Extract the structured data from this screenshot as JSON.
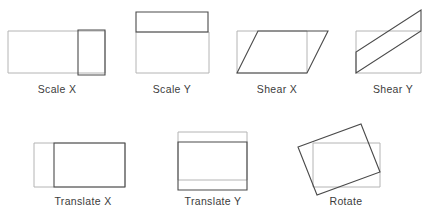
{
  "figure": {
    "width": 436,
    "height": 219,
    "background_color": "#ffffff",
    "original_shape_color": "#b4b4b4",
    "transformed_shape_color": "#4a4a4a",
    "label_color": "#3c3c3c"
  },
  "cells": [
    {
      "id": "scale-x",
      "label": "Scale X",
      "label_x": 57,
      "label_y": 93,
      "original": {
        "type": "rect",
        "points": "8,31 105,31 105,73 8,73"
      },
      "transformed": {
        "type": "rect",
        "points": "78,30 105,30 105,75 78,75"
      }
    },
    {
      "id": "scale-y",
      "label": "Scale Y",
      "label_x": 172,
      "label_y": 93,
      "original": {
        "type": "rect",
        "points": "136,32 209,32 209,73 136,73"
      },
      "transformed": {
        "type": "rect",
        "points": "136,12 208,12 208,32 136,32"
      }
    },
    {
      "id": "shear-x",
      "label": "Shear X",
      "label_x": 277,
      "label_y": 93,
      "original": {
        "type": "rect",
        "points": "237,31 307,31 307,73 237,73"
      },
      "transformed": {
        "type": "parallelogram",
        "points": "237,73 258,31 328,31 307,73"
      }
    },
    {
      "id": "shear-y",
      "label": "Shear Y",
      "label_x": 393,
      "label_y": 93,
      "original": {
        "type": "rect",
        "points": "356,31 421,31 421,73 356,73"
      },
      "transformed": {
        "type": "parallelogram",
        "points": "356,73 356,52 421,10 421,31"
      }
    },
    {
      "id": "translate-x",
      "label": "Translate X",
      "label_x": 83,
      "label_y": 205,
      "original": {
        "type": "rect",
        "points": "34,143 125,143 125,187 34,187"
      },
      "transformed": {
        "type": "rect",
        "points": "54,143 125,143 125,187 54,187"
      }
    },
    {
      "id": "translate-y",
      "label": "Translate Y",
      "label_x": 213,
      "label_y": 205,
      "original": {
        "type": "rect",
        "points": "178,132 247,132 247,180 178,180"
      },
      "transformed": {
        "type": "rect",
        "points": "178,142 247,142 247,190 178,190"
      }
    },
    {
      "id": "rotate",
      "label": "Rotate",
      "label_x": 346,
      "label_y": 205,
      "original": {
        "type": "rect",
        "points": "313,143 380,143 380,187 313,187"
      },
      "transformed": {
        "type": "rotated-rect",
        "points": "298,147 361,124 380,172 317,195"
      }
    }
  ]
}
